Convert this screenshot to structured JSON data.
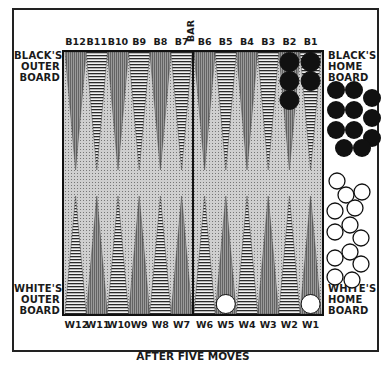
{
  "diagram": {
    "type": "backgammon-board",
    "caption": "AFTER FIVE MOVES",
    "bar_label": "BAR",
    "labels": {
      "black_outer": [
        "BLACK'S",
        "OUTER",
        "BOARD"
      ],
      "black_home": [
        "BLACK'S",
        "HOME",
        "BOARD"
      ],
      "white_outer": [
        "WHITE'S",
        "OUTER",
        "BOARD"
      ],
      "white_home": [
        "WHITE'S",
        "HOME",
        "BOARD"
      ]
    },
    "top_points": [
      "B12",
      "B11",
      "B10",
      "B9",
      "B8",
      "B7",
      "B6",
      "B5",
      "B4",
      "B3",
      "B2",
      "B1"
    ],
    "bottom_points": [
      "W12",
      "W11",
      "W10",
      "W9",
      "W8",
      "W7",
      "W6",
      "W5",
      "W4",
      "W3",
      "W2",
      "W1"
    ],
    "checkers_on_points": [
      {
        "point": "B2",
        "color": "black",
        "count": 3
      },
      {
        "point": "B1",
        "color": "black",
        "count": 2
      },
      {
        "point": "W5",
        "color": "white",
        "count": 1
      },
      {
        "point": "W1",
        "color": "white",
        "count": 1
      }
    ],
    "borne_off": {
      "black": 11,
      "white": 13
    },
    "colors": {
      "black_checker": "#111111",
      "white_checker": "#ffffff",
      "board": "#cfcfcf",
      "point_dark": "#8a8a8a",
      "point_striped": "#333333"
    }
  }
}
